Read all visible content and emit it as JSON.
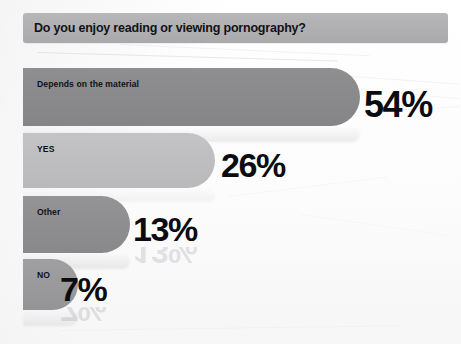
{
  "chart_data": {
    "type": "bar",
    "title": "Do you enjoy reading or viewing pornography?",
    "orientation": "horizontal",
    "categories": [
      "Depends on the material",
      "YES",
      "Other",
      "NO"
    ],
    "values": [
      54,
      26,
      13,
      7
    ],
    "value_labels": [
      "54%",
      "26%",
      "13%",
      "7%"
    ],
    "xlabel": "",
    "ylabel": "",
    "xlim": [
      0,
      100
    ],
    "grid": false,
    "legend": "none",
    "unit": "percent",
    "colors": {
      "title_banner": "#b1b1b3",
      "bar_depends": "#8a8a8d",
      "bar_yes": "#bebec1",
      "bar_other": "#8e8e91",
      "bar_no": "#9a9a9d",
      "label_text": "#0b0c0f",
      "background": "#ffffff"
    }
  },
  "bars": [
    {
      "label": "Depends on the material",
      "value_label": "54%"
    },
    {
      "label": "YES",
      "value_label": "26%"
    },
    {
      "label": "Other",
      "value_label": "13%"
    },
    {
      "label": "NO",
      "value_label": "7%"
    }
  ]
}
